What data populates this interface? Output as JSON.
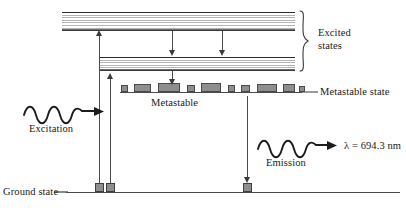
{
  "figure": {
    "background_color": "#ffffff",
    "line_color": "#3a3a3a",
    "block_fill_color": "#8e8e8e",
    "band_stripe_color": "#b4b4b4"
  },
  "labels": {
    "excited_states_line1": "Excited",
    "excited_states_line2": "states",
    "metastable_state": "Metastable state",
    "metastable": "Metastable",
    "excitation": "Excitation",
    "emission": "Emission",
    "wavelength": "λ = 694.3 nm",
    "ground_state": "Ground state"
  },
  "diagram_data": {
    "type": "energy-level-diagram",
    "levels": [
      {
        "name": "upper-excited-band",
        "kind": "band",
        "x": 62,
        "width": 233,
        "y": 12,
        "height": 18,
        "stripe_count": 7
      },
      {
        "name": "lower-excited-band",
        "kind": "band",
        "x": 100,
        "width": 195,
        "y": 57,
        "height": 13,
        "stripe_count": 5
      },
      {
        "name": "metastable-level",
        "kind": "blocks-on-line",
        "x": 120,
        "width": 182,
        "y": 92
      },
      {
        "name": "ground-level",
        "kind": "line",
        "x": 66,
        "width": 334,
        "y": 192
      }
    ],
    "metastable_blocks": [
      {
        "x": 121,
        "w": 7,
        "h": 7
      },
      {
        "x": 134,
        "w": 17,
        "h": 8
      },
      {
        "x": 158,
        "w": 22,
        "h": 9
      },
      {
        "x": 187,
        "w": 8,
        "h": 7
      },
      {
        "x": 201,
        "w": 20,
        "h": 9
      },
      {
        "x": 228,
        "w": 7,
        "h": 7
      },
      {
        "x": 241,
        "w": 9,
        "h": 7
      },
      {
        "x": 257,
        "w": 20,
        "h": 8
      },
      {
        "x": 283,
        "w": 12,
        "h": 8
      },
      {
        "x": 299,
        "w": 6,
        "h": 6
      }
    ],
    "ground_blocks": [
      {
        "x": 95,
        "w": 9,
        "h": 9
      },
      {
        "x": 106,
        "w": 9,
        "h": 9
      },
      {
        "x": 243,
        "w": 9,
        "h": 9
      }
    ],
    "transitions": [
      {
        "name": "pump-to-upper-band",
        "direction": "up",
        "x": 99,
        "from_y": 188,
        "to_y": 31
      },
      {
        "name": "pump-to-metastable",
        "direction": "up",
        "x": 110,
        "from_y": 188,
        "to_y": 73
      },
      {
        "name": "nonradiative-decay-1",
        "direction": "down",
        "x": 172,
        "from_y": 31,
        "to_y": 56
      },
      {
        "name": "nonradiative-decay-2",
        "direction": "down",
        "x": 222,
        "from_y": 31,
        "to_y": 56
      },
      {
        "name": "decay-to-metastable",
        "direction": "down",
        "x": 172,
        "from_y": 71,
        "to_y": 86
      },
      {
        "name": "lasing-emission",
        "direction": "down",
        "x": 247,
        "from_y": 96,
        "to_y": 188
      }
    ],
    "waves": [
      {
        "name": "excitation-wave",
        "x": 24,
        "y": 112,
        "peaks": 4,
        "arrow": "right"
      },
      {
        "name": "emission-wave",
        "x": 258,
        "y": 146,
        "peaks": 4,
        "arrow": "right"
      }
    ],
    "brace": {
      "name": "excited-states-brace",
      "x": 300,
      "top_y": 10,
      "bottom_y": 72
    }
  }
}
